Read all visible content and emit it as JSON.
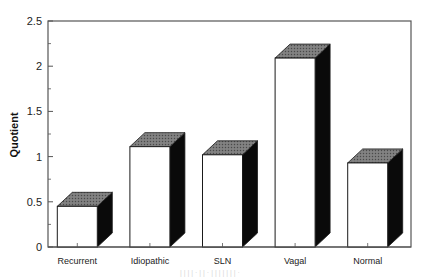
{
  "chart_data": {
    "type": "bar",
    "style": "3d",
    "title": "",
    "xlabel": "",
    "ylabel": "Quotient",
    "categories": [
      "Recurrent",
      "Idiopathic",
      "SLN",
      "Vagal",
      "Normal"
    ],
    "values": [
      0.45,
      1.11,
      1.02,
      2.09,
      0.93
    ],
    "ylim": [
      0,
      2.5
    ],
    "yticks": [
      0,
      0.5,
      1,
      1.5,
      2,
      2.5
    ],
    "ytick_labels": [
      "0",
      "0.5",
      "1",
      "1.5",
      "2",
      "2.5"
    ],
    "minor_ytick_step": 0.25,
    "grid": false,
    "legend": null,
    "colors": {
      "front": "#ffffff",
      "top": "#6e6e6e",
      "side": "#0a0a0a",
      "outline": "#1a1a1a",
      "axis": "#555555"
    }
  }
}
